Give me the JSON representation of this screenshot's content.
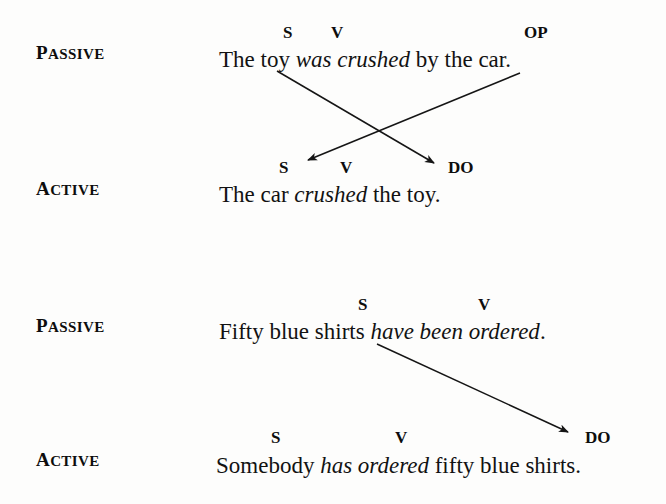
{
  "figure": {
    "type": "grammar-transformation-diagram",
    "background_color": "#fdfdfc",
    "text_color": "#121212",
    "arrow_color": "#151515"
  },
  "examples": [
    {
      "id": "example-1",
      "passive": {
        "voice_label": {
          "initial": "P",
          "rest": "ASSIVE"
        },
        "sentence_parts": [
          {
            "text": "The toy ",
            "style": "roman"
          },
          {
            "text": "was crushed",
            "style": "italic"
          },
          {
            "text": " by the car.",
            "style": "roman"
          }
        ],
        "sentence_plain": "The toy was crushed by the car.",
        "tags": [
          {
            "label": "S",
            "over": "toy",
            "x": 283,
            "y": 24
          },
          {
            "label": "V",
            "over": "was",
            "x": 331,
            "y": 24
          },
          {
            "label": "OP",
            "over": "car",
            "x": 524,
            "y": 24
          }
        ]
      },
      "active": {
        "voice_label": {
          "initial": "A",
          "rest": "CTIVE"
        },
        "sentence_parts": [
          {
            "text": "The car ",
            "style": "roman"
          },
          {
            "text": "crushed",
            "style": "italic"
          },
          {
            "text": " the toy.",
            "style": "roman"
          }
        ],
        "sentence_plain": "The car crushed the toy.",
        "tags": [
          {
            "label": "S",
            "over": "car",
            "x": 279,
            "y": 159
          },
          {
            "label": "V",
            "over": "crushed",
            "x": 340,
            "y": 159
          },
          {
            "label": "DO",
            "over": "toy",
            "x": 448,
            "y": 159
          }
        ]
      },
      "arrows": [
        {
          "name": "subject-to-object-arrow",
          "from_role": "S (passive subject: toy)",
          "to_role": "DO (active direct object)",
          "x1": 277,
          "y1": 71,
          "x2": 438,
          "y2": 166
        },
        {
          "name": "object-of-prep-to-subject-arrow",
          "from_role": "OP (object of preposition: car)",
          "to_role": "S (active subject)",
          "x1": 520,
          "y1": 73,
          "x2": 304,
          "y2": 162
        }
      ]
    },
    {
      "id": "example-2",
      "passive": {
        "voice_label": {
          "initial": "P",
          "rest": "ASSIVE"
        },
        "sentence_parts": [
          {
            "text": "Fifty blue shirts ",
            "style": "roman"
          },
          {
            "text": "have been ordered",
            "style": "italic"
          },
          {
            "text": ".",
            "style": "roman"
          }
        ],
        "sentence_plain": "Fifty blue shirts have been ordered.",
        "tags": [
          {
            "label": "S",
            "over": "shirts",
            "x": 358,
            "y": 296
          },
          {
            "label": "V",
            "over": "have been",
            "x": 478,
            "y": 296
          }
        ]
      },
      "active": {
        "voice_label": {
          "initial": "A",
          "rest": "CTIVE"
        },
        "sentence_parts": [
          {
            "text": "Somebody ",
            "style": "roman"
          },
          {
            "text": "has ordered",
            "style": "italic"
          },
          {
            "text": " fifty blue shirts.",
            "style": "roman"
          }
        ],
        "sentence_plain": "Somebody has ordered fifty blue shirts.",
        "tags": [
          {
            "label": "S",
            "over": "Somebody",
            "x": 271,
            "y": 429
          },
          {
            "label": "V",
            "over": "has ordered",
            "x": 395,
            "y": 429
          },
          {
            "label": "DO",
            "over": "fifty blue shirts",
            "x": 585,
            "y": 429
          }
        ]
      },
      "arrows": [
        {
          "name": "subject-to-direct-object-arrow",
          "from_role": "S (passive subject: fifty blue shirts)",
          "to_role": "DO (active direct object)",
          "x1": 377,
          "y1": 344,
          "x2": 572,
          "y2": 434
        }
      ]
    }
  ],
  "positions": {
    "voice_label_1": {
      "x": 36,
      "y": 42
    },
    "voice_label_2": {
      "x": 36,
      "y": 178
    },
    "voice_label_3": {
      "x": 36,
      "y": 315
    },
    "voice_label_4": {
      "x": 36,
      "y": 449
    },
    "sentence_1": {
      "x": 219,
      "y": 48
    },
    "sentence_2": {
      "x": 219,
      "y": 183
    },
    "sentence_3": {
      "x": 219,
      "y": 320
    },
    "sentence_4": {
      "x": 216,
      "y": 454
    }
  }
}
